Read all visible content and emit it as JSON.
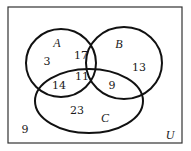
{
  "diagram": {
    "type": "venn-3",
    "universe": {
      "label": "U",
      "outside_count": "9"
    },
    "sets": [
      {
        "id": "A",
        "label": "A"
      },
      {
        "id": "B",
        "label": "B"
      },
      {
        "id": "C",
        "label": "C"
      }
    ],
    "regions": {
      "A_only": "3",
      "B_only": "13",
      "C_only": "23",
      "A_and_B_only": "17",
      "A_and_C_only": "14",
      "B_and_C_only": "9",
      "A_and_B_and_C": "11",
      "none": "9"
    }
  }
}
